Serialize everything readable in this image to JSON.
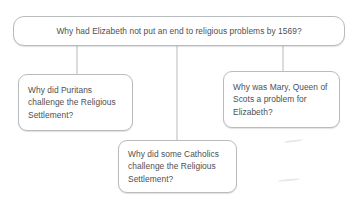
{
  "diagram": {
    "type": "question-tree",
    "background_color": "#ffffff",
    "node_border_color": "#b9bcbe",
    "node_fill_color": "#ffffff",
    "text_color": "#4d4f52",
    "connector_color": "#bcbfc1",
    "root": {
      "id": "root",
      "text": "Why had Elizabeth not put an end to religious problems by 1569?"
    },
    "branches": [
      {
        "id": "puritans",
        "position": "left",
        "text": "Why did Puritans challenge the Religious Settlement?"
      },
      {
        "id": "catholics",
        "position": "bottom-centre",
        "text": "Why did some Catholics challenge the Religious Settlement?"
      },
      {
        "id": "mary",
        "position": "right",
        "text": "Why was Mary, Queen of Scots a problem for Elizabeth?"
      }
    ],
    "connectors": [
      {
        "id": "root-to-puritans",
        "from": "root",
        "to": "puritans"
      },
      {
        "id": "root-to-catholics",
        "from": "root",
        "to": "catholics"
      },
      {
        "id": "root-to-mary",
        "from": "root",
        "to": "mary"
      }
    ]
  }
}
